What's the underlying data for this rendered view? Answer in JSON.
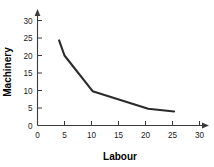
{
  "chart_data": {
    "type": "line",
    "title": "",
    "xlabel": "Labour",
    "ylabel": "Machinery",
    "xlim": [
      0,
      32
    ],
    "ylim": [
      0,
      32
    ],
    "grid": false,
    "legend": "none",
    "x_ticks": [
      0,
      5,
      10,
      15,
      20,
      25,
      30
    ],
    "y_ticks": [
      0,
      5,
      10,
      15,
      20,
      25,
      30
    ],
    "x_tick_labels": [
      "0",
      "5",
      "10",
      "15",
      "20",
      "25",
      "30"
    ],
    "y_tick_labels": [
      "0",
      "5",
      "10",
      "15",
      "20",
      "25",
      "30"
    ],
    "series": [
      {
        "name": "isoquant",
        "color": "#2b2b2b",
        "x": [
          4.0,
          5.0,
          10.2,
          20.5,
          25.3
        ],
        "y": [
          24.3,
          20.0,
          9.8,
          4.8,
          4.0
        ]
      }
    ]
  },
  "labels": {
    "x_axis_title": "Labour",
    "y_axis_title": "Machinery"
  },
  "colors": {
    "curve": "#2b2b2b",
    "axis": "#3b3b3b",
    "text": "#000000",
    "background": "#ffffff"
  }
}
